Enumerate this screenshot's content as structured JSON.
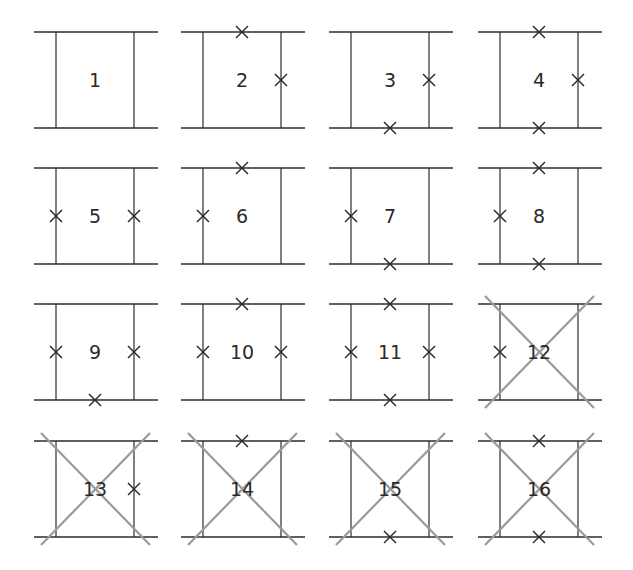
{
  "diagram": {
    "layout": {
      "columns": 4,
      "rows": 4
    },
    "colors": {
      "line": "#2b2b2b",
      "cross": "#2b2b2b",
      "strike": "#9a9a9a",
      "background": "#ffffff"
    },
    "legend_note": "Each panel: two horizontal rails with two vertical rungs; x marks denote removed/cut segments; gray diagonal X strikes out a panel.",
    "panels": [
      {
        "label": "1",
        "crosses": [],
        "struck": false
      },
      {
        "label": "2",
        "crosses": [
          "top",
          "right"
        ],
        "struck": false
      },
      {
        "label": "3",
        "crosses": [
          "right",
          "bottom"
        ],
        "struck": false
      },
      {
        "label": "4",
        "crosses": [
          "top",
          "right",
          "bottom"
        ],
        "struck": false
      },
      {
        "label": "5",
        "crosses": [
          "left",
          "right"
        ],
        "struck": false
      },
      {
        "label": "6",
        "crosses": [
          "top",
          "left"
        ],
        "struck": false
      },
      {
        "label": "7",
        "crosses": [
          "left",
          "bottom"
        ],
        "struck": false
      },
      {
        "label": "8",
        "crosses": [
          "top",
          "left",
          "bottom"
        ],
        "struck": false
      },
      {
        "label": "9",
        "crosses": [
          "left",
          "right",
          "bottom"
        ],
        "struck": false
      },
      {
        "label": "10",
        "crosses": [
          "top",
          "left",
          "right"
        ],
        "struck": false
      },
      {
        "label": "11",
        "crosses": [
          "top",
          "left",
          "right",
          "bottom"
        ],
        "struck": false
      },
      {
        "label": "12",
        "crosses": [
          "left"
        ],
        "struck": true
      },
      {
        "label": "13",
        "crosses": [
          "right"
        ],
        "struck": true
      },
      {
        "label": "14",
        "crosses": [
          "top"
        ],
        "struck": true
      },
      {
        "label": "15",
        "crosses": [
          "bottom"
        ],
        "struck": true
      },
      {
        "label": "16",
        "crosses": [
          "top",
          "bottom"
        ],
        "struck": true
      }
    ]
  }
}
